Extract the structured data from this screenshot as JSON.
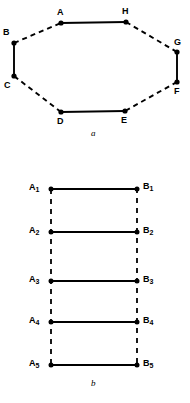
{
  "figure": {
    "background_color": "#ffffff",
    "ink_color": "#000000",
    "panels": [
      {
        "id": "panel-a",
        "caption": "a",
        "caption_pos": {
          "x": 91,
          "y": 129
        },
        "type": "octagon-cycle",
        "nodes": [
          {
            "label": "A",
            "x": 61,
            "y": 23,
            "label_x": 57,
            "label_y": 8
          },
          {
            "label": "H",
            "x": 126,
            "y": 22,
            "label_x": 122,
            "label_y": 7
          },
          {
            "label": "G",
            "x": 177,
            "y": 52,
            "label_x": 174,
            "label_y": 38
          },
          {
            "label": "F",
            "x": 177,
            "y": 82,
            "label_x": 174,
            "label_y": 87
          },
          {
            "label": "E",
            "x": 125,
            "y": 111,
            "label_x": 121,
            "label_y": 116
          },
          {
            "label": "D",
            "x": 61,
            "y": 112,
            "label_x": 57,
            "label_y": 117
          },
          {
            "label": "C",
            "x": 14,
            "y": 76,
            "label_x": 4,
            "label_y": 81
          },
          {
            "label": "B",
            "x": 14,
            "y": 43,
            "label_x": 3,
            "label_y": 28
          }
        ],
        "edges": [
          {
            "from": "A",
            "to": "H",
            "style": "solid"
          },
          {
            "from": "H",
            "to": "G",
            "style": "dashed"
          },
          {
            "from": "G",
            "to": "F",
            "style": "solid"
          },
          {
            "from": "F",
            "to": "E",
            "style": "dashed"
          },
          {
            "from": "E",
            "to": "D",
            "style": "solid"
          },
          {
            "from": "D",
            "to": "C",
            "style": "dashed"
          },
          {
            "from": "C",
            "to": "B",
            "style": "solid"
          },
          {
            "from": "B",
            "to": "A",
            "style": "dashed"
          }
        ]
      },
      {
        "id": "panel-b",
        "caption": "b",
        "caption_pos": {
          "x": 91,
          "y": 379
        },
        "type": "ladder",
        "left_rail": {
          "x": 51,
          "y_top": 189,
          "y_bottom": 365,
          "style": "dashed"
        },
        "right_rail": {
          "x": 137,
          "y_top": 188,
          "y_bottom": 365,
          "style": "dashed"
        },
        "rungs": [
          {
            "y": 189,
            "style": "solid",
            "left": {
              "base": "A",
              "sub": "1",
              "x": 51,
              "label_x": 29,
              "label_y": 183
            },
            "right": {
              "base": "B",
              "sub": "1",
              "x": 137,
              "label_x": 143,
              "label_y": 182
            }
          },
          {
            "y": 232,
            "style": "solid",
            "left": {
              "base": "A",
              "sub": "2",
              "x": 51,
              "label_x": 29,
              "label_y": 226
            },
            "right": {
              "base": "B",
              "sub": "2",
              "x": 137,
              "label_x": 143,
              "label_y": 226
            }
          },
          {
            "y": 281,
            "style": "solid",
            "left": {
              "base": "A",
              "sub": "3",
              "x": 51,
              "label_x": 29,
              "label_y": 275
            },
            "right": {
              "base": "B",
              "sub": "3",
              "x": 137,
              "label_x": 143,
              "label_y": 275
            }
          },
          {
            "y": 322,
            "style": "solid",
            "left": {
              "base": "A",
              "sub": "4",
              "x": 51,
              "label_x": 29,
              "label_y": 316
            },
            "right": {
              "base": "B",
              "sub": "4",
              "x": 137,
              "label_x": 143,
              "label_y": 316
            }
          },
          {
            "y": 365,
            "style": "solid",
            "left": {
              "base": "A",
              "sub": "5",
              "x": 51,
              "label_x": 29,
              "label_y": 359
            },
            "right": {
              "base": "B",
              "sub": "5",
              "x": 137,
              "label_x": 143,
              "label_y": 359
            }
          }
        ]
      }
    ]
  }
}
